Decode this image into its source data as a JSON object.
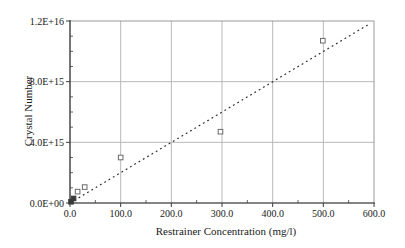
{
  "chart_data": {
    "type": "scatter",
    "title": "",
    "xlabel": "Restrainer Concentration (mg/l)",
    "ylabel": "Crystal Number",
    "xlim": [
      0,
      600
    ],
    "ylim": [
      0,
      1.2e+16
    ],
    "grid": true,
    "x_ticks": {
      "values": [
        0,
        100,
        200,
        300,
        400,
        500,
        600
      ],
      "labels": [
        "0.0",
        "100.0",
        "200.0",
        "300.0",
        "400.0",
        "500.0",
        "600.0"
      ]
    },
    "y_ticks": {
      "values": [
        0,
        4000000000000000.0,
        8000000000000000.0,
        1.2e+16
      ],
      "labels": [
        "0.0E+00",
        "4.0E+15",
        "8.0E+15",
        "1.2E+16"
      ]
    },
    "x_minor_ticks": [
      50,
      150,
      250,
      350,
      450,
      550
    ],
    "y_minor_ticks": [
      1000000000000000.0,
      2000000000000000.0,
      3000000000000000.0,
      5000000000000000.0,
      6000000000000000.0,
      7000000000000000.0,
      9000000000000000.0,
      1e+16,
      1.1e+16
    ],
    "x_gridlines": [
      100,
      200,
      300,
      400,
      500
    ],
    "y_gridlines": [
      4000000000000000.0,
      8000000000000000.0
    ],
    "points": [
      {
        "x": 2,
        "y": 80000000000000.0,
        "filled": true
      },
      {
        "x": 7,
        "y": 300000000000000.0,
        "filled": true
      },
      {
        "x": 15,
        "y": 750000000000000.0,
        "filled": false
      },
      {
        "x": 29,
        "y": 1050000000000000.0,
        "filled": false
      },
      {
        "x": 100,
        "y": 3000000000000000.0,
        "filled": false
      },
      {
        "x": 297,
        "y": 4700000000000000.0,
        "filled": false
      },
      {
        "x": 499,
        "y": 1.07e+16,
        "filled": false
      }
    ],
    "trend_line": {
      "x1": 0,
      "y1": 0,
      "x2": 588,
      "y2": 1.175e+16,
      "style": "dashed"
    },
    "legend": null,
    "colors": {
      "grid": "#b8b8b8",
      "frame": "#9a9a9a",
      "axis": "#3c3c3c",
      "tick": "#3c3c3c",
      "text": "#1a1a1a",
      "marker_stroke": "#6a6a6a",
      "marker_fill": "#ffffff",
      "marker_fill_dark": "#3a3a3a",
      "trend": "#2e2e2e"
    }
  }
}
